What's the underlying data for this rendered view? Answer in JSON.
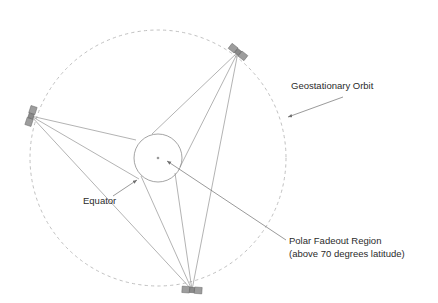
{
  "figure": {
    "canvas": {
      "width": 438,
      "height": 303
    },
    "background_color": "#ffffff"
  },
  "colors": {
    "orbit_stroke": "#b9b9b9",
    "earth_stroke": "#8d8d8d",
    "sight_line": "#8a8a8a",
    "leader_line": "#6f6f6f",
    "text": "#2b2b2b",
    "satellite_panel": "#9d9d9d",
    "satellite_body": "#8a8a8a"
  },
  "geometry": {
    "orbit": {
      "cx": 158,
      "cy": 158,
      "r": 128,
      "style": "dashed"
    },
    "earth": {
      "cx": 158,
      "cy": 158,
      "r": 24,
      "style": "solid"
    },
    "earth_center_dot": {
      "cx": 158,
      "cy": 158,
      "r": 1.3
    }
  },
  "satellites": [
    {
      "id": "sat-west",
      "name": "satellite-west",
      "x": 31,
      "y": 116,
      "rotation": -72
    },
    {
      "id": "sat-northeast",
      "name": "satellite-northeast",
      "x": 238,
      "y": 52,
      "rotation": 38
    },
    {
      "id": "sat-south",
      "name": "satellite-south",
      "x": 192,
      "y": 290,
      "rotation": 4
    }
  ],
  "sight_lines": [
    {
      "name": "west-tangent-upper",
      "x1": 31,
      "y1": 116,
      "x2": 136,
      "y2": 140
    },
    {
      "name": "west-tangent-lower",
      "x1": 31,
      "y1": 116,
      "x2": 139,
      "y2": 179
    },
    {
      "name": "west-to-south",
      "x1": 31,
      "y1": 116,
      "x2": 192,
      "y2": 290
    },
    {
      "name": "northeast-tangent-left",
      "x1": 238,
      "y1": 52,
      "x2": 152,
      "y2": 134
    },
    {
      "name": "northeast-tangent-right",
      "x1": 238,
      "y1": 52,
      "x2": 180,
      "y2": 167
    },
    {
      "name": "northeast-to-south",
      "x1": 238,
      "y1": 52,
      "x2": 192,
      "y2": 290
    },
    {
      "name": "south-tangent-left",
      "x1": 192,
      "y1": 290,
      "x2": 141,
      "y2": 176
    },
    {
      "name": "south-tangent-right",
      "x1": 192,
      "y1": 290,
      "x2": 175,
      "y2": 173
    }
  ],
  "annotations": [
    {
      "id": "geostationary-orbit",
      "name": "geostationary-orbit-label",
      "lines": [
        "Geostationary Orbit"
      ],
      "text_x": 291,
      "text_y": 89,
      "anchor": "start",
      "leader": {
        "x1": 343,
        "y1": 97,
        "x2": 288,
        "y2": 117
      },
      "arrow_at_end": true
    },
    {
      "id": "equator",
      "name": "equator-label",
      "lines": [
        "Equator"
      ],
      "text_x": 83,
      "text_y": 204,
      "anchor": "start",
      "leader": {
        "x1": 113,
        "y1": 196,
        "x2": 137,
        "y2": 180
      },
      "arrow_at_end": true
    },
    {
      "id": "polar-fadeout-region",
      "name": "polar-fadeout-region-label",
      "lines": [
        "Polar Fadeout Region",
        "(above 70 degrees latitude)"
      ],
      "text_x": 289,
      "text_y": 244,
      "anchor": "start",
      "leader": {
        "x1": 286,
        "y1": 240,
        "x2": 167,
        "y2": 161
      },
      "arrow_at_end": true
    }
  ]
}
